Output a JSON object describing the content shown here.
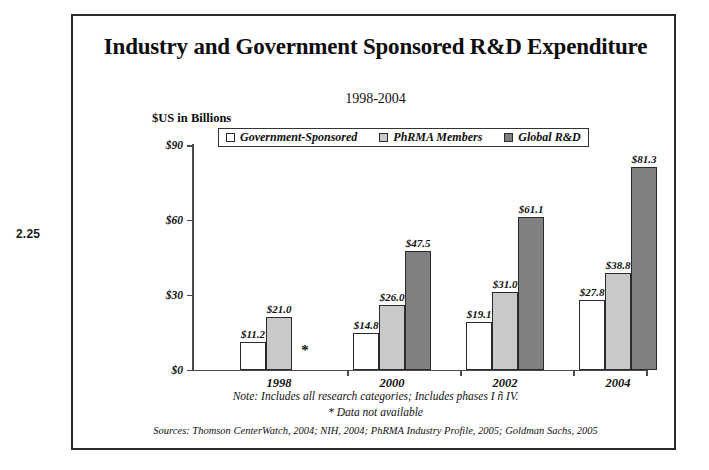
{
  "page": {
    "margin_label": "2.25"
  },
  "figure": {
    "title": "Industry and Government Sponsored R&D Expenditure",
    "subtitle": "1998-2004",
    "axis_unit_label": "$US in Billions",
    "note_1": "Note:  Includes all research categories; Includes phases I ñ IV.",
    "note_2": "* Data not available",
    "sources": "Sources:  Thomson CenterWatch, 2004; NIH, 2004; PhRMA Industry Profile, 2005; Goldman Sachs, 2005"
  },
  "legend": {
    "entries": [
      {
        "label": "Government-Sponsored",
        "color": "#ffffff"
      },
      {
        "label": "PhRMA Members",
        "color": "#c9c9c9"
      },
      {
        "label": "Global R&D",
        "color": "#808080"
      }
    ]
  },
  "chart_data": {
    "type": "bar",
    "title": "Industry and Government Sponsored R&D Expenditure",
    "subtitle": "1998-2004",
    "xlabel": "",
    "ylabel": "$US in Billions",
    "ylim": [
      0,
      90
    ],
    "yticks": [
      0,
      30,
      60,
      90
    ],
    "ytick_labels": [
      "$0",
      "$30",
      "$60",
      "$90"
    ],
    "grid": false,
    "legend_position": "top-left-inside",
    "categories": [
      "1998",
      "2000",
      "2002",
      "2004"
    ],
    "series": [
      {
        "name": "Government-Sponsored",
        "color": "#ffffff",
        "values": [
          11.2,
          14.8,
          19.1,
          27.8
        ],
        "labels": [
          "$11.2",
          "$14.8",
          "$19.1",
          "$27.8"
        ]
      },
      {
        "name": "PhRMA Members",
        "color": "#c9c9c9",
        "values": [
          21.0,
          26.0,
          31.0,
          38.8
        ],
        "labels": [
          "$21.0",
          "$26.0",
          "$31.0",
          "$38.8"
        ]
      },
      {
        "name": "Global R&D",
        "color": "#808080",
        "values": [
          null,
          47.5,
          61.1,
          81.3
        ],
        "labels": [
          "*",
          "$47.5",
          "$61.1",
          "$81.3"
        ]
      }
    ],
    "annotations": [
      {
        "text": "*",
        "category": "1998",
        "series": "Global R&D",
        "meaning": "Data not available"
      }
    ]
  }
}
